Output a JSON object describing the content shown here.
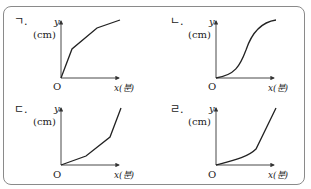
{
  "figure": {
    "type": "four-panel graph comparison",
    "panels": [
      {
        "id": "ga",
        "label": "ㄱ.",
        "y_axis_label": "y",
        "y_unit": "(cm)",
        "x_axis_label": "x(분)",
        "origin_label": "O",
        "shape": "concave increasing (piecewise linear, slopes decreasing)"
      },
      {
        "id": "na",
        "label": "ㄴ.",
        "y_axis_label": "y",
        "y_unit": "(cm)",
        "x_axis_label": "x(분)",
        "origin_label": "O",
        "shape": "S-shaped increasing curve"
      },
      {
        "id": "da",
        "label": "ㄷ.",
        "y_axis_label": "y",
        "y_unit": "(cm)",
        "x_axis_label": "x(분)",
        "origin_label": "O",
        "shape": "convex increasing (piecewise linear, slopes increasing)"
      },
      {
        "id": "ra",
        "label": "ㄹ.",
        "y_axis_label": "y",
        "y_unit": "(cm)",
        "x_axis_label": "x(분)",
        "origin_label": "O",
        "shape": "convex increasing curve then straight line"
      }
    ]
  },
  "colors": {
    "border": "#8a8a8a",
    "axis": "#333333",
    "curve": "#222222"
  }
}
